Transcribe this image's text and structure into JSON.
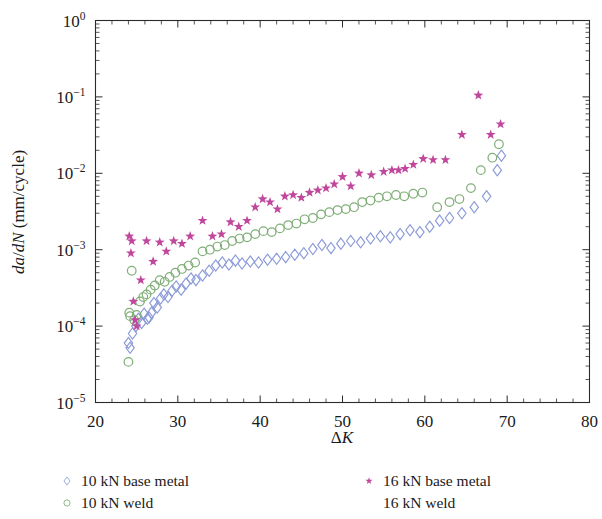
{
  "chart_data": {
    "type": "scatter",
    "title": "",
    "xlabel": "ΔK",
    "ylabel": "da/dN (mm/cycle)",
    "xscale": "linear",
    "yscale": "log",
    "xlim": [
      20,
      80
    ],
    "ylim": [
      1e-05,
      1
    ],
    "xticks": [
      20,
      30,
      40,
      50,
      60,
      70,
      80
    ],
    "xticklabels": [
      "20",
      "30",
      "40",
      "50",
      "60",
      "70",
      "80"
    ],
    "yticks": [
      1e-05,
      0.0001,
      0.001,
      0.01,
      0.1,
      1
    ],
    "yticklabels": [
      "10⁻⁵",
      "10⁻⁴",
      "10⁻³",
      "10⁻²",
      "10⁻¹",
      "10⁰"
    ],
    "grid": false,
    "legend_position": "below-axes",
    "series": [
      {
        "name": "10 kN base metal",
        "marker": "diamond-open",
        "color": "#8b9ad8",
        "points": [
          [
            24.0,
            6e-05
          ],
          [
            24.2,
            5.2e-05
          ],
          [
            24.5,
            8e-05
          ],
          [
            24.9,
            0.0001
          ],
          [
            25.2,
            0.000125
          ],
          [
            25.6,
            0.00011
          ],
          [
            25.9,
            0.000145
          ],
          [
            26.3,
            0.000125
          ],
          [
            26.5,
            0.00013
          ],
          [
            26.8,
            0.00015
          ],
          [
            27.1,
            0.0002
          ],
          [
            27.5,
            0.000175
          ],
          [
            27.9,
            0.00023
          ],
          [
            28.3,
            0.00026
          ],
          [
            28.8,
            0.00024
          ],
          [
            29.3,
            0.00029
          ],
          [
            29.8,
            0.00033
          ],
          [
            30.4,
            0.0003
          ],
          [
            31.0,
            0.00036
          ],
          [
            31.6,
            0.00042
          ],
          [
            32.2,
            0.0004
          ],
          [
            33.0,
            0.00046
          ],
          [
            33.8,
            0.00053
          ],
          [
            34.6,
            0.00062
          ],
          [
            35.4,
            0.00068
          ],
          [
            36.2,
            0.00064
          ],
          [
            37.0,
            0.00072
          ],
          [
            37.8,
            0.00066
          ],
          [
            38.8,
            0.0007
          ],
          [
            39.8,
            0.00068
          ],
          [
            40.9,
            0.00074
          ],
          [
            42.0,
            0.00076
          ],
          [
            43.1,
            0.0008
          ],
          [
            44.2,
            0.00086
          ],
          [
            45.3,
            0.0009
          ],
          [
            46.4,
            0.00102
          ],
          [
            47.5,
            0.00115
          ],
          [
            48.6,
            0.00105
          ],
          [
            49.8,
            0.0012
          ],
          [
            51.0,
            0.0013
          ],
          [
            52.2,
            0.00125
          ],
          [
            53.4,
            0.0014
          ],
          [
            54.6,
            0.0015
          ],
          [
            55.8,
            0.00145
          ],
          [
            57.0,
            0.0016
          ],
          [
            58.2,
            0.0018
          ],
          [
            59.4,
            0.0017
          ],
          [
            60.6,
            0.002
          ],
          [
            61.8,
            0.0024
          ],
          [
            63.0,
            0.0026
          ],
          [
            64.5,
            0.003
          ],
          [
            66.0,
            0.0036
          ],
          [
            67.5,
            0.005
          ],
          [
            68.8,
            0.011
          ],
          [
            69.3,
            0.017
          ]
        ]
      },
      {
        "name": "10 kN weld",
        "marker": "circle-open",
        "color": "#7fae77",
        "points": [
          [
            24.0,
            3.4e-05
          ],
          [
            24.1,
            0.00015
          ],
          [
            24.2,
            0.000135
          ],
          [
            24.4,
            0.00053
          ],
          [
            24.7,
            0.00012
          ],
          [
            25.0,
            0.00014
          ],
          [
            25.4,
            0.00021
          ],
          [
            25.8,
            0.00024
          ],
          [
            26.2,
            0.00026
          ],
          [
            26.7,
            0.0003
          ],
          [
            27.2,
            0.00034
          ],
          [
            27.8,
            0.0004
          ],
          [
            28.4,
            0.00038
          ],
          [
            29.0,
            0.00044
          ],
          [
            29.7,
            0.0005
          ],
          [
            30.5,
            0.00056
          ],
          [
            31.3,
            0.00062
          ],
          [
            32.1,
            0.00068
          ],
          [
            33.0,
            0.00095
          ],
          [
            33.9,
            0.001
          ],
          [
            34.8,
            0.0011
          ],
          [
            35.7,
            0.00115
          ],
          [
            36.6,
            0.0013
          ],
          [
            37.5,
            0.0014
          ],
          [
            38.4,
            0.00145
          ],
          [
            39.4,
            0.0016
          ],
          [
            40.4,
            0.00175
          ],
          [
            41.4,
            0.0017
          ],
          [
            42.4,
            0.0019
          ],
          [
            43.4,
            0.0021
          ],
          [
            44.4,
            0.0022
          ],
          [
            45.4,
            0.0025
          ],
          [
            46.4,
            0.0026
          ],
          [
            47.4,
            0.0029
          ],
          [
            48.4,
            0.0031
          ],
          [
            49.4,
            0.0033
          ],
          [
            50.4,
            0.0034
          ],
          [
            51.4,
            0.0036
          ],
          [
            52.4,
            0.0042
          ],
          [
            53.4,
            0.0044
          ],
          [
            54.4,
            0.0048
          ],
          [
            55.4,
            0.005
          ],
          [
            56.5,
            0.0052
          ],
          [
            57.5,
            0.005
          ],
          [
            58.6,
            0.0054
          ],
          [
            59.7,
            0.0056
          ],
          [
            61.5,
            0.0036
          ],
          [
            63.0,
            0.0042
          ],
          [
            64.2,
            0.0046
          ],
          [
            65.6,
            0.0064
          ],
          [
            66.8,
            0.011
          ],
          [
            68.2,
            0.016
          ],
          [
            69.0,
            0.024
          ]
        ]
      },
      {
        "name": "16 kN base metal",
        "marker": "star",
        "color": "#c0489c",
        "points": [
          [
            24.1,
            0.0015
          ],
          [
            24.3,
            0.0009
          ],
          [
            24.4,
            0.0013
          ],
          [
            24.6,
            0.00021
          ],
          [
            24.8,
            0.00012
          ],
          [
            25.0,
            0.0001
          ],
          [
            25.5,
            0.0004
          ],
          [
            26.2,
            0.0013
          ],
          [
            27.0,
            0.0007
          ],
          [
            27.8,
            0.00125
          ],
          [
            28.6,
            0.00095
          ],
          [
            29.5,
            0.0013
          ],
          [
            30.5,
            0.0012
          ],
          [
            31.5,
            0.0015
          ],
          [
            33.0,
            0.0024
          ],
          [
            34.2,
            0.0015
          ],
          [
            35.3,
            0.0016
          ],
          [
            36.4,
            0.0023
          ],
          [
            37.4,
            0.002
          ],
          [
            38.4,
            0.0024
          ],
          [
            39.4,
            0.0036
          ],
          [
            40.3,
            0.0046
          ],
          [
            41.2,
            0.0042
          ],
          [
            42.1,
            0.0034
          ],
          [
            43.0,
            0.005
          ],
          [
            44.0,
            0.0052
          ],
          [
            45.0,
            0.0048
          ],
          [
            46.0,
            0.0056
          ],
          [
            47.0,
            0.006
          ],
          [
            48.0,
            0.0064
          ],
          [
            49.0,
            0.0072
          ],
          [
            50.0,
            0.009
          ],
          [
            51.0,
            0.0068
          ],
          [
            52.0,
            0.01
          ],
          [
            53.5,
            0.0095
          ],
          [
            55.0,
            0.0105
          ],
          [
            56.0,
            0.011
          ],
          [
            56.8,
            0.011
          ],
          [
            57.6,
            0.0115
          ],
          [
            58.6,
            0.013
          ],
          [
            59.8,
            0.0155
          ],
          [
            61.0,
            0.015
          ],
          [
            62.5,
            0.015
          ],
          [
            64.5,
            0.032
          ],
          [
            66.5,
            0.105
          ],
          [
            68.0,
            0.032
          ],
          [
            69.2,
            0.044
          ]
        ]
      },
      {
        "name": "16 kN weld",
        "marker": "none",
        "color": "#f2eef2",
        "points": []
      }
    ]
  },
  "legend": {
    "entries": [
      {
        "label": "10 kN base metal",
        "marker": "diamond-open",
        "color": "#8b9ad8"
      },
      {
        "label": "10 kN weld",
        "marker": "circle-open",
        "color": "#7fae77"
      },
      {
        "label": "16 kN base metal",
        "marker": "star",
        "color": "#c0489c"
      },
      {
        "label": "16 kN weld",
        "marker": "none",
        "color": "#e8e2e8"
      }
    ]
  },
  "axes": {
    "x_title_main": "Δ",
    "x_title_italic": "K",
    "y_title_italic_1": "da",
    "y_title_slash_1": "/",
    "y_title_italic_2": "dN",
    "y_title_units": " (mm/cycle)"
  }
}
